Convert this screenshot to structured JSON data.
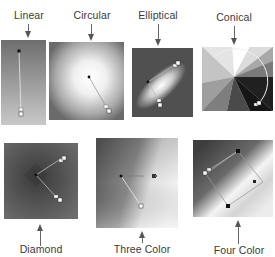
{
  "figure": {
    "gradient_types": [
      {
        "id": "linear",
        "label": "Linear",
        "position": "top"
      },
      {
        "id": "circular",
        "label": "Circular",
        "position": "top"
      },
      {
        "id": "elliptical",
        "label": "Elliptical",
        "position": "top"
      },
      {
        "id": "conical",
        "label": "Conical",
        "position": "top"
      },
      {
        "id": "diamond",
        "label": "Diamond",
        "position": "bottom"
      },
      {
        "id": "three-color",
        "label": "Three Color",
        "position": "bottom"
      },
      {
        "id": "four-color",
        "label": "Four Color",
        "position": "bottom"
      }
    ]
  },
  "colors": {
    "label_text": "#3a3a3a",
    "arrow": "#555555",
    "background": "#ffffff"
  }
}
